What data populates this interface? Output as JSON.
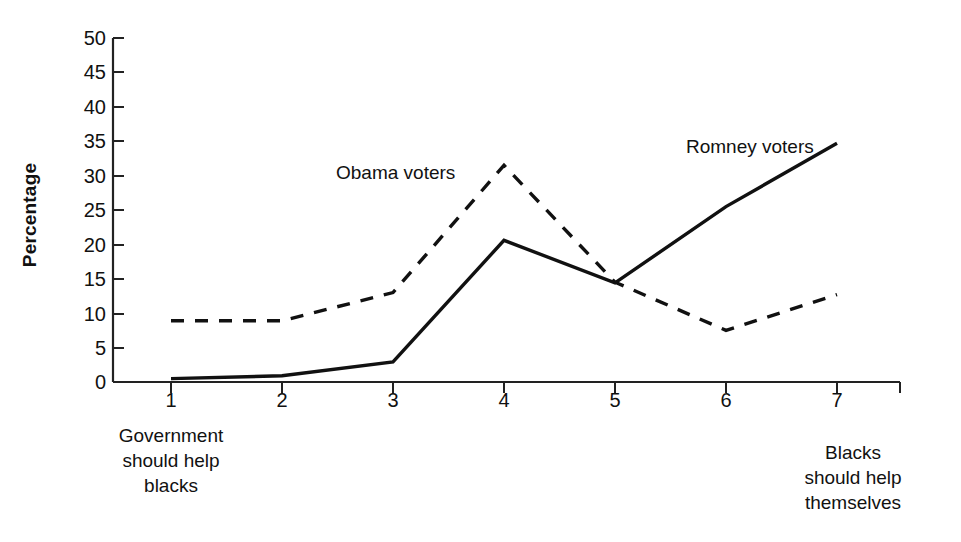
{
  "chart_data": {
    "type": "line",
    "title": "",
    "subtitle": "",
    "xlabel": "",
    "ylabel": "Percentage",
    "x": [
      1,
      2,
      3,
      4,
      5,
      6,
      7
    ],
    "categories": [
      "1",
      "2",
      "3",
      "4",
      "5",
      "6",
      "7"
    ],
    "xlim": [
      1,
      7
    ],
    "ylim": [
      0,
      50
    ],
    "yticks": [
      0,
      5,
      10,
      15,
      20,
      25,
      30,
      35,
      40,
      45,
      50
    ],
    "ytick_labels": [
      "0",
      "5",
      "10",
      "15",
      "20",
      "25",
      "30",
      "35",
      "40",
      "45",
      "50"
    ],
    "xtick_labels": [
      "1",
      "2",
      "3",
      "4",
      "5",
      "6",
      "7"
    ],
    "grid": false,
    "legend": "inline-annotations",
    "axis_anchors": {
      "left": "Government\nshould help\nblacks",
      "left_lines": [
        "Government",
        "should help",
        "blacks"
      ],
      "right": "Blacks\nshould help\nthemselves",
      "right_lines": [
        "Blacks",
        "should help",
        "themselves"
      ]
    },
    "series": [
      {
        "name": "Obama voters",
        "style": "dashed",
        "color": "#111111",
        "values": [
          8.9,
          8.9,
          13.0,
          31.5,
          14.5,
          7.5,
          12.7
        ]
      },
      {
        "name": "Romney voters",
        "style": "solid",
        "color": "#111111",
        "values": [
          0.5,
          0.9,
          2.9,
          20.6,
          14.4,
          25.5,
          34.7
        ]
      }
    ],
    "annotations": [
      {
        "text": "Obama voters",
        "series": "Obama voters"
      },
      {
        "text": "Romney voters",
        "series": "Romney voters"
      }
    ]
  },
  "colors": {
    "background": "#ffffff",
    "axis": "#222222",
    "text": "#111111",
    "series_obama": "#111111",
    "series_romney": "#111111"
  }
}
